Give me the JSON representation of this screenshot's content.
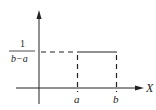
{
  "diagram": {
    "type": "uniform-distribution-pdf",
    "y_level_label": {
      "numerator": "1",
      "denominator": "b−a"
    },
    "x_axis_label": "X",
    "x_ticks": [
      {
        "label": "a"
      },
      {
        "label": "b"
      }
    ],
    "colors": {
      "stroke": "#222222",
      "background": "#ffffff"
    }
  }
}
